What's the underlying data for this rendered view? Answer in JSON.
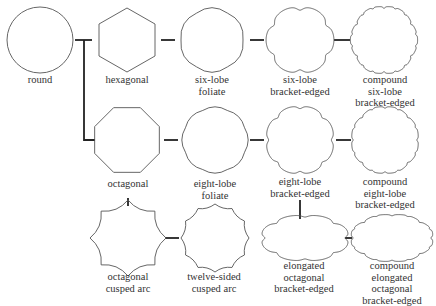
{
  "diagram": {
    "nodes": [
      {
        "id": "round",
        "lines": [
          "round"
        ]
      },
      {
        "id": "hexagonal",
        "lines": [
          "hexagonal"
        ]
      },
      {
        "id": "six-lobe-foliate",
        "lines": [
          "six-lobe",
          "foliate"
        ]
      },
      {
        "id": "six-lobe-bracket-edged",
        "lines": [
          "six-lobe",
          "bracket-edged"
        ]
      },
      {
        "id": "compound-six-lobe-bracket-edged",
        "lines": [
          "compound",
          "six-lobe",
          "bracket-edged"
        ]
      },
      {
        "id": "octagonal",
        "lines": [
          "octagonal"
        ]
      },
      {
        "id": "eight-lobe-foliate",
        "lines": [
          "eight-lobe",
          "foliate"
        ]
      },
      {
        "id": "eight-lobe-bracket-edged",
        "lines": [
          "eight-lobe",
          "bracket-edged"
        ]
      },
      {
        "id": "compound-eight-lobe-bracket-edged",
        "lines": [
          "compound",
          "eight-lobe",
          "bracket-edged"
        ]
      },
      {
        "id": "octagonal-cusped-arc",
        "lines": [
          "octagonal",
          "cusped arc"
        ]
      },
      {
        "id": "twelve-sided-cusped-arc",
        "lines": [
          "twelve-sided",
          "cusped arc"
        ]
      },
      {
        "id": "elongated-octagonal-bracket-edged",
        "lines": [
          "elongated",
          "octagonal",
          "bracket-edged"
        ]
      },
      {
        "id": "compound-elongated-octagonal-bracket-edged",
        "lines": [
          "compound",
          "elongated",
          "octagonal",
          "bracket-edged"
        ]
      }
    ],
    "edges": [
      [
        "round",
        "hexagonal"
      ],
      [
        "round",
        "octagonal"
      ],
      [
        "hexagonal",
        "six-lobe-foliate"
      ],
      [
        "six-lobe-foliate",
        "six-lobe-bracket-edged"
      ],
      [
        "six-lobe-bracket-edged",
        "compound-six-lobe-bracket-edged"
      ],
      [
        "octagonal",
        "eight-lobe-foliate"
      ],
      [
        "eight-lobe-foliate",
        "eight-lobe-bracket-edged"
      ],
      [
        "eight-lobe-bracket-edged",
        "compound-eight-lobe-bracket-edged"
      ],
      [
        "octagonal",
        "octagonal-cusped-arc"
      ],
      [
        "octagonal-cusped-arc",
        "twelve-sided-cusped-arc"
      ],
      [
        "eight-lobe-bracket-edged",
        "elongated-octagonal-bracket-edged"
      ],
      [
        "elongated-octagonal-bracket-edged",
        "compound-elongated-octagonal-bracket-edged"
      ]
    ],
    "colors": {
      "stroke": "#555555",
      "connector": "#222222",
      "text": "#333333",
      "background": "#ffffff"
    }
  }
}
